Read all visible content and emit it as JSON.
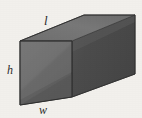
{
  "figure": {
    "name": "rectangular-prism",
    "background_color": "#f2f0ec",
    "labels": {
      "length": "l",
      "height": "h",
      "width": "w"
    },
    "colors": {
      "top_face": "#757575",
      "front_face": "#6e6e6e",
      "front_face_shadow": "#5f5f5f",
      "right_face": "#4a4a4a",
      "right_face_highlight": "#565656",
      "edge": "#3a3a3a",
      "background": "#f2f0ec",
      "label_text": "#2b2b2b"
    },
    "geometry": {
      "front_top_left": [
        20,
        41
      ],
      "front_top_right": [
        72,
        41
      ],
      "front_bottom_right": [
        72,
        97
      ],
      "front_bottom_left": [
        20,
        105
      ],
      "back_top_left": [
        84,
        15
      ],
      "back_top_right": [
        135,
        15
      ],
      "back_bottom_right": [
        135,
        74
      ],
      "back_bottom_left": [
        84,
        74
      ]
    }
  }
}
